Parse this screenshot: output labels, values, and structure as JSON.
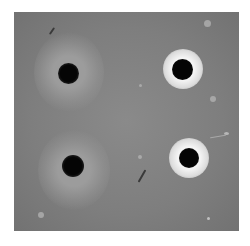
{
  "image": {
    "description": "Grayscale photograph of an agar diffusion plate with four wells",
    "wells": [
      {
        "id": "top-left",
        "zone": "diffuse grey halo"
      },
      {
        "id": "top-right",
        "zone": "bright white ring"
      },
      {
        "id": "bottom-left",
        "zone": "diffuse grey halo"
      },
      {
        "id": "bottom-right",
        "zone": "bright white ring"
      }
    ],
    "colors": {
      "background": "#ffffff",
      "agar": "#808080",
      "well": "#0a0a0a",
      "bright_ring": "#f0f0f0",
      "diffuse_halo": "#9a9a9a"
    }
  }
}
